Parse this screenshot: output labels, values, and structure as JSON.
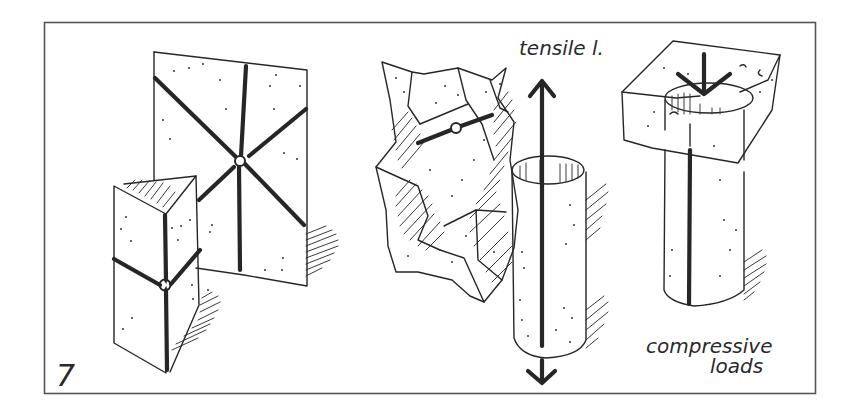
{
  "figure": {
    "number": "7",
    "frame": {
      "x": 44,
      "y": 22,
      "w": 772,
      "h": 372,
      "stroke": "#555555"
    },
    "ink_color": "#262626",
    "background": "#ffffff"
  },
  "labels": {
    "tensile": "tensile l.",
    "compressive_line1": "compressive",
    "compressive_line2": "loads",
    "figure_number": "7"
  },
  "elements": [
    {
      "name": "radial-slab",
      "description": "Flat rectangular slab with six radial thick lines meeting at a central node"
    },
    {
      "name": "triangular-prism",
      "description": "Vertical triangular prism with thick edge lines and a node at mid-height"
    },
    {
      "name": "crumpled-shell",
      "description": "Irregular crumpled faceted shell with hatched shading and a short bar with a node"
    },
    {
      "name": "tensile-cylinder",
      "description": "Vertical cylinder with a thick axial line and arrows pointing up and down (tensile load)"
    },
    {
      "name": "compressive-column",
      "description": "Cylinder embedded in a block with a downward arrow on top (compressive load)"
    }
  ],
  "arrows": [
    {
      "name": "tensile-up-arrow",
      "direction": "up"
    },
    {
      "name": "tensile-down-arrow",
      "direction": "down"
    },
    {
      "name": "compressive-down-arrow",
      "direction": "down"
    }
  ]
}
